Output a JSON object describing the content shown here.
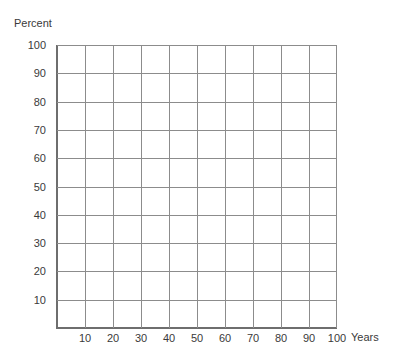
{
  "chart_data": {
    "type": "line",
    "title": "",
    "xlabel": "Years",
    "ylabel": "Percent",
    "x_ticks": [
      "10",
      "20",
      "30",
      "40",
      "50",
      "60",
      "70",
      "80",
      "90",
      "100"
    ],
    "y_ticks": [
      "100",
      "90",
      "80",
      "70",
      "60",
      "50",
      "40",
      "30",
      "20",
      "10"
    ],
    "xlim": [
      0,
      100
    ],
    "ylim": [
      0,
      100
    ],
    "grid": true,
    "series": [],
    "legend": null,
    "colors": {
      "grid": "#8c8c8c",
      "axis": "#6e6e6e",
      "text": "#3a3a3a"
    }
  }
}
